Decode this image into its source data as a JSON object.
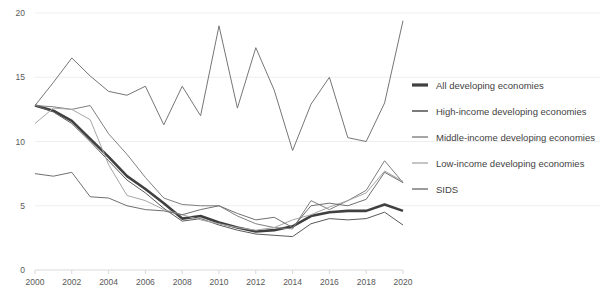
{
  "chart_data": {
    "type": "line",
    "title": "",
    "subtitle": "",
    "xlabel": "",
    "ylabel": "",
    "xlim": [
      2000,
      2020
    ],
    "ylim": [
      0,
      20
    ],
    "yticks": [
      0,
      5,
      10,
      15,
      20
    ],
    "xticks": [
      2000,
      2002,
      2004,
      2006,
      2008,
      2010,
      2012,
      2014,
      2016,
      2018,
      2020
    ],
    "grid": true,
    "legend_position": "right",
    "x": [
      2000,
      2001,
      2002,
      2003,
      2004,
      2005,
      2006,
      2007,
      2008,
      2009,
      2010,
      2011,
      2012,
      2013,
      2014,
      2015,
      2016,
      2017,
      2018,
      2019,
      2020
    ],
    "series": [
      {
        "name": "All developing economies",
        "color": "#404040",
        "width": 2.6,
        "values": [
          12.8,
          12.4,
          11.6,
          10.2,
          8.8,
          7.3,
          6.3,
          5.2,
          4.0,
          4.2,
          3.7,
          3.3,
          3.0,
          3.1,
          3.4,
          4.2,
          4.5,
          4.6,
          4.6,
          5.1,
          4.6
        ]
      },
      {
        "name": "High-income developing economies",
        "color": "#5a5a5a",
        "width": 1.0,
        "values": [
          12.8,
          12.3,
          11.4,
          10.0,
          8.5,
          7.0,
          6.0,
          4.8,
          3.8,
          4.0,
          3.5,
          3.1,
          2.8,
          2.7,
          2.6,
          3.6,
          4.0,
          3.9,
          4.0,
          4.5,
          3.5
        ]
      },
      {
        "name": "Middle-income developing economies",
        "color": "#808080",
        "width": 1.0,
        "values": [
          12.8,
          12.7,
          12.5,
          12.8,
          10.6,
          9.0,
          7.2,
          5.6,
          5.1,
          5.0,
          5.0,
          4.2,
          3.6,
          3.3,
          3.2,
          5.4,
          4.7,
          5.4,
          6.2,
          8.5,
          6.8
        ]
      },
      {
        "name": "Low-income developing economies",
        "color": "#a6a6a6",
        "width": 1.0,
        "values": [
          11.4,
          12.6,
          12.5,
          11.7,
          8.2,
          5.8,
          5.4,
          4.7,
          4.3,
          3.9,
          3.6,
          3.3,
          3.1,
          3.3,
          3.9,
          4.3,
          4.9,
          5.4,
          6.0,
          7.7,
          6.9
        ]
      },
      {
        "name": "SIDS",
        "color": "#707070",
        "width": 1.0,
        "values": [
          7.5,
          7.3,
          7.6,
          5.7,
          5.6,
          5.0,
          4.7,
          4.6,
          4.3,
          4.7,
          5.0,
          4.4,
          3.9,
          4.1,
          3.3,
          5.0,
          5.2,
          5.0,
          5.5,
          7.6,
          6.8
        ]
      },
      {
        "name": "SIDS volatile",
        "color": "#767676",
        "width": 1.0,
        "values": [
          12.8,
          14.6,
          16.5,
          15.1,
          13.9,
          13.6,
          14.3,
          11.3,
          14.3,
          12.0,
          19.0,
          12.6,
          17.3,
          14.0,
          9.3,
          12.9,
          15.0,
          10.3,
          10.0,
          13.0,
          19.4
        ]
      }
    ],
    "legend": [
      {
        "label": "All developing economies",
        "color": "#404040",
        "width": 3.2
      },
      {
        "label": "High-income developing economies",
        "color": "#5a5a5a",
        "width": 1.6
      },
      {
        "label": "Middle-income developing economies",
        "color": "#808080",
        "width": 1.4
      },
      {
        "label": "Low-income developing economies",
        "color": "#a6a6a6",
        "width": 1.3
      },
      {
        "label": "SIDS",
        "color": "#707070",
        "width": 1.4
      }
    ],
    "axis": {
      "y_labels": [
        "20",
        "15",
        "10",
        "5",
        "0"
      ],
      "x_labels": [
        "2000",
        "2002",
        "2004",
        "2006",
        "2008",
        "2010",
        "2012",
        "2014",
        "2016",
        "2018",
        "2020"
      ]
    }
  }
}
